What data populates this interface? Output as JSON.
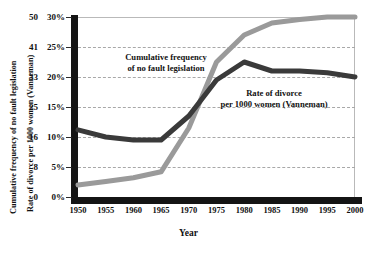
{
  "chart_data": {
    "type": "line",
    "title": "",
    "xlabel": "Year",
    "ylabel_outer": "Cumulative frequency of no fault legislation",
    "ylabel_inner": "Rate of divorce per 1000 women (Vanneman)",
    "grid": true,
    "legend_position": "inline-annotations",
    "x": [
      1950,
      1955,
      1960,
      1965,
      1970,
      1975,
      1980,
      1985,
      1990,
      1995,
      2000
    ],
    "xlim": [
      1950,
      2000
    ],
    "xticks": [
      "1950",
      "1955",
      "1960",
      "1965",
      "1970",
      "1975",
      "1980",
      "1985",
      "1990",
      "1995",
      "2000"
    ],
    "ylim_pct": [
      0,
      30
    ],
    "yticks_pct": [
      "30%",
      "25%",
      "20%",
      "15%",
      "10%",
      "5%",
      "0%"
    ],
    "yticks_pct_values": [
      30,
      25,
      20,
      15,
      10,
      5,
      0
    ],
    "yticks_count": [
      "50",
      "41",
      "33",
      "25",
      "16",
      "8",
      "0"
    ],
    "yticks_count_values": [
      50,
      41,
      33,
      25,
      16,
      8,
      0
    ],
    "series": [
      {
        "name": "Cumulative frequency of no fault legislation",
        "color": "#9a9a9a",
        "values": [
          2.0,
          2.6,
          3.2,
          4.2,
          11.5,
          22.5,
          27.0,
          29.0,
          29.6,
          30.0,
          30.0
        ]
      },
      {
        "name": "Rate of divorce per 1000 women (Vanneman)",
        "color": "#3a3a3a",
        "values": [
          11.2,
          10.0,
          9.5,
          9.5,
          13.5,
          19.5,
          22.5,
          21.0,
          21.0,
          20.7,
          20.0
        ]
      }
    ],
    "annotations": [
      {
        "name": "cumulative-frequency-annotation",
        "text": "Cumulative frequency\nof no fault legislation"
      },
      {
        "name": "divorce-rate-annotation",
        "text": "Rate of divorce\nper 1000 women (Vanneman)"
      }
    ]
  }
}
